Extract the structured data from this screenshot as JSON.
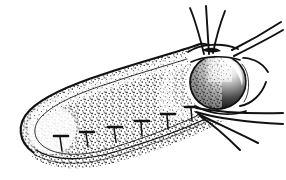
{
  "figure": {
    "style": "black-and-white stipple engraving",
    "background_color": "#ffffff",
    "ink_color": "#111111",
    "canvas": {
      "width": 286,
      "height": 180
    }
  },
  "parts": {
    "body": {
      "name": "elongated capsule body",
      "description": "Long rounded sac tilted down-left, outlined with a double contour line and stippled interior margin"
    },
    "rounded_end": {
      "name": "rounded anterior end",
      "description": "Blunt rounded left terminus with dense stipple shading along the rim"
    },
    "dark_ovoid": {
      "name": "dark ovoid organ",
      "description": "Heavily shaded oval mass at the right end, darkest at lower-left, graded lighter toward upper-right"
    },
    "neck": {
      "name": "neck stalk",
      "description": "Narrow curved connector joining the ovoid to the filament junction on the right"
    },
    "ventral_band": {
      "name": "ventral ribbed band",
      "description": "Stippled band along the lower edge bearing a row of small T-shaped attachment marks",
      "tick_count": 6
    },
    "filaments": {
      "name": "radiating filaments",
      "upper_vertical_count": 3,
      "upper_right_count": 2,
      "lower_right_count": 4,
      "total": 9,
      "description": "Fine hair-like strands fanning out from the right junction point"
    }
  },
  "labels": {
    "figure_caption": "",
    "scale_bar": ""
  }
}
